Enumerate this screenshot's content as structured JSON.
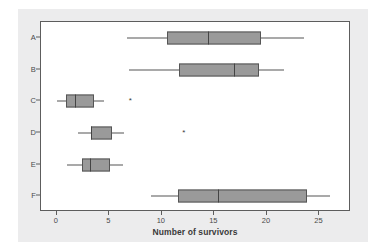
{
  "chart_data": {
    "type": "box",
    "title": "",
    "xlabel": "Number of survivors",
    "ylabel": "",
    "orientation": "horizontal",
    "xlim": [
      -1.5,
      28
    ],
    "xticks": [
      0,
      5,
      10,
      15,
      20,
      25
    ],
    "xticklabels": [
      "0",
      "5",
      "10",
      "15",
      "20",
      "25"
    ],
    "categories": [
      "A",
      "B",
      "C",
      "D",
      "E",
      "F"
    ],
    "grid": false,
    "legend": false,
    "box_fill_color": "#9a9a9a",
    "box_edge_color": "#555555",
    "panel_color": "#ececed",
    "boxes": [
      {
        "category": "A",
        "whisker_low": 6.7,
        "q1": 10.5,
        "median": 14.4,
        "q3": 19.4,
        "whisker_high": 23.5,
        "outliers": []
      },
      {
        "category": "B",
        "whisker_low": 6.9,
        "q1": 11.6,
        "median": 16.9,
        "q3": 19.2,
        "whisker_high": 21.6,
        "outliers": []
      },
      {
        "category": "C",
        "whisker_low": 0.0,
        "q1": 0.9,
        "median": 1.7,
        "q3": 3.5,
        "whisker_high": 4.5,
        "outliers": [
          7.0
        ]
      },
      {
        "category": "D",
        "whisker_low": 2.0,
        "q1": 3.3,
        "median": 3.3,
        "q3": 5.3,
        "whisker_high": 6.4,
        "outliers": [
          12.1
        ]
      },
      {
        "category": "E",
        "whisker_low": 1.0,
        "q1": 2.4,
        "median": 3.2,
        "q3": 5.1,
        "whisker_high": 6.3,
        "outliers": []
      },
      {
        "category": "F",
        "whisker_low": 9.0,
        "q1": 11.5,
        "median": 15.3,
        "q3": 23.8,
        "whisker_high": 26.0,
        "outliers": []
      }
    ],
    "outlier_marker": "*"
  }
}
